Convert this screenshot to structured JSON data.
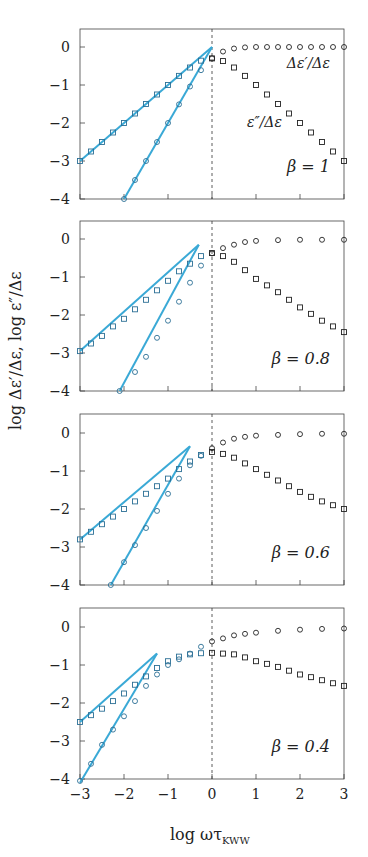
{
  "chart_data": {
    "type": "scatter",
    "xlabel": "log ωτ",
    "xlabel_sub": "KWW",
    "ylabel": "log Δε′/Δε, log ε″/Δε",
    "xlim": [
      -3,
      3
    ],
    "ylim": [
      -4,
      0.5
    ],
    "xticks": [
      -3,
      -2,
      -1,
      0,
      1,
      2,
      3
    ],
    "yticks": [
      0,
      -1,
      -2,
      -3,
      -4
    ],
    "vline_x": 0,
    "fit_color": "#3aa9d6",
    "marker_color": "#222222",
    "annotations": [
      "Δε′/Δε",
      "ε″/Δε"
    ],
    "panels": [
      {
        "label": "β = 1",
        "series": [
          {
            "name": "Δε′/Δε",
            "marker": "circle",
            "x": [
              -2,
              -1.75,
              -1.5,
              -1.25,
              -1,
              -0.75,
              -0.5,
              -0.25,
              0,
              0.25,
              0.5,
              0.75,
              1,
              1.25,
              1.5,
              1.75,
              2,
              2.25,
              2.5,
              2.75,
              3
            ],
            "y": [
              -4.0,
              -3.5,
              -3.0,
              -2.5,
              -2.0,
              -1.51,
              -1.04,
              -0.61,
              -0.3,
              -0.12,
              -0.04,
              -0.01,
              0,
              0,
              0,
              0,
              0,
              0,
              0,
              0,
              0
            ]
          },
          {
            "name": "ε″/Δε",
            "marker": "square",
            "x": [
              -3,
              -2.75,
              -2.5,
              -2.25,
              -2,
              -1.75,
              -1.5,
              -1.25,
              -1,
              -0.75,
              -0.5,
              -0.25,
              0,
              0.25,
              0.5,
              0.75,
              1,
              1.25,
              1.5,
              1.75,
              2,
              2.25,
              2.5,
              2.75,
              3
            ],
            "y": [
              -3.0,
              -2.75,
              -2.5,
              -2.25,
              -2.0,
              -1.75,
              -1.5,
              -1.25,
              -1.0,
              -0.76,
              -0.54,
              -0.36,
              -0.3,
              -0.37,
              -0.54,
              -0.76,
              -1.0,
              -1.25,
              -1.5,
              -1.75,
              -2.0,
              -2.25,
              -2.5,
              -2.75,
              -3.0
            ]
          }
        ],
        "fits": [
          [
            [
              -2,
              -4
            ],
            [
              0,
              0
            ]
          ],
          [
            [
              -3,
              -3
            ],
            [
              0,
              0
            ]
          ]
        ]
      },
      {
        "label": "β = 0.8",
        "series": [
          {
            "name": "Δε′/Δε",
            "marker": "circle",
            "x": [
              -2.1,
              -1.75,
              -1.5,
              -1.25,
              -1,
              -0.75,
              -0.5,
              -0.25,
              0,
              0.25,
              0.5,
              0.75,
              1,
              1.5,
              2,
              2.5,
              3
            ],
            "y": [
              -4.0,
              -3.5,
              -3.1,
              -2.6,
              -2.15,
              -1.65,
              -1.15,
              -0.7,
              -0.38,
              -0.24,
              -0.15,
              -0.08,
              -0.05,
              -0.03,
              -0.02,
              -0.02,
              -0.02
            ]
          },
          {
            "name": "ε″/Δε",
            "marker": "square",
            "x": [
              -3,
              -2.75,
              -2.5,
              -2.25,
              -2,
              -1.75,
              -1.5,
              -1.25,
              -1,
              -0.75,
              -0.5,
              -0.25,
              0,
              0.25,
              0.5,
              0.75,
              1,
              1.25,
              1.5,
              1.75,
              2,
              2.25,
              2.5,
              2.75,
              3
            ],
            "y": [
              -2.95,
              -2.75,
              -2.55,
              -2.3,
              -2.1,
              -1.85,
              -1.6,
              -1.35,
              -1.1,
              -0.85,
              -0.65,
              -0.45,
              -0.37,
              -0.45,
              -0.6,
              -0.82,
              -1.05,
              -1.22,
              -1.4,
              -1.6,
              -1.8,
              -1.97,
              -2.15,
              -2.3,
              -2.45
            ]
          }
        ],
        "fits": [
          [
            [
              -2.1,
              -4
            ],
            [
              -0.3,
              -0.15
            ]
          ],
          [
            [
              -3,
              -2.95
            ],
            [
              -0.3,
              -0.15
            ]
          ]
        ]
      },
      {
        "label": "β = 0.6",
        "series": [
          {
            "name": "Δε′/Δε",
            "marker": "circle",
            "x": [
              -2.3,
              -2,
              -1.75,
              -1.5,
              -1.25,
              -1,
              -0.75,
              -0.5,
              -0.25,
              0,
              0.25,
              0.5,
              0.75,
              1,
              1.5,
              2,
              2.5,
              3
            ],
            "y": [
              -4.0,
              -3.4,
              -2.95,
              -2.5,
              -2.05,
              -1.6,
              -1.2,
              -0.85,
              -0.6,
              -0.4,
              -0.25,
              -0.15,
              -0.1,
              -0.07,
              -0.05,
              -0.03,
              -0.02,
              -0.02
            ]
          },
          {
            "name": "ε″/Δε",
            "marker": "square",
            "x": [
              -3,
              -2.75,
              -2.5,
              -2.25,
              -2,
              -1.75,
              -1.5,
              -1.25,
              -1,
              -0.75,
              -0.5,
              -0.25,
              0,
              0.25,
              0.5,
              0.75,
              1,
              1.25,
              1.5,
              1.75,
              2,
              2.25,
              2.5,
              2.75,
              3
            ],
            "y": [
              -2.8,
              -2.6,
              -2.4,
              -2.2,
              -2.0,
              -1.8,
              -1.6,
              -1.4,
              -1.2,
              -0.95,
              -0.75,
              -0.58,
              -0.5,
              -0.55,
              -0.65,
              -0.8,
              -0.95,
              -1.1,
              -1.25,
              -1.4,
              -1.55,
              -1.68,
              -1.8,
              -1.9,
              -2.0
            ]
          }
        ],
        "fits": [
          [
            [
              -2.3,
              -4
            ],
            [
              -0.5,
              -0.35
            ]
          ],
          [
            [
              -3,
              -2.8
            ],
            [
              -0.5,
              -0.35
            ]
          ]
        ]
      },
      {
        "label": "β = 0.4",
        "series": [
          {
            "name": "Δε′/Δε",
            "marker": "circle",
            "x": [
              -3,
              -2.75,
              -2.5,
              -2.25,
              -2,
              -1.75,
              -1.5,
              -1.25,
              -1,
              -0.75,
              -0.5,
              -0.25,
              0,
              0.25,
              0.5,
              0.75,
              1,
              1.5,
              2,
              2.5,
              3
            ],
            "y": [
              -4.05,
              -3.6,
              -3.1,
              -2.7,
              -2.35,
              -1.95,
              -1.55,
              -1.25,
              -1.0,
              -0.85,
              -0.7,
              -0.52,
              -0.38,
              -0.3,
              -0.22,
              -0.18,
              -0.15,
              -0.1,
              -0.07,
              -0.05,
              -0.04
            ]
          },
          {
            "name": "ε″/Δε",
            "marker": "square",
            "x": [
              -3,
              -2.75,
              -2.5,
              -2.25,
              -2,
              -1.75,
              -1.5,
              -1.25,
              -1,
              -0.75,
              -0.5,
              -0.25,
              0,
              0.25,
              0.5,
              0.75,
              1,
              1.25,
              1.5,
              1.75,
              2,
              2.25,
              2.5,
              2.75,
              3
            ],
            "y": [
              -2.5,
              -2.32,
              -2.15,
              -1.95,
              -1.75,
              -1.52,
              -1.3,
              -1.08,
              -0.9,
              -0.78,
              -0.72,
              -0.69,
              -0.68,
              -0.7,
              -0.72,
              -0.8,
              -0.9,
              -0.97,
              -1.05,
              -1.15,
              -1.25,
              -1.32,
              -1.4,
              -1.48,
              -1.55
            ]
          }
        ],
        "fits": [
          [
            [
              -3,
              -4.1
            ],
            [
              -1.25,
              -0.7
            ]
          ],
          [
            [
              -3,
              -2.5
            ],
            [
              -1.25,
              -0.7
            ]
          ]
        ]
      }
    ]
  }
}
